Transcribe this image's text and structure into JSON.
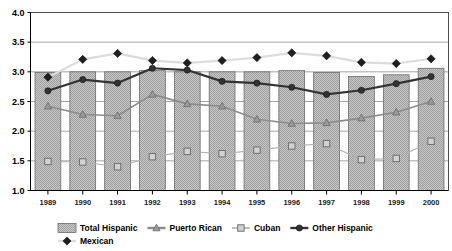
{
  "chart_data": {
    "type": "bar",
    "title": "",
    "xlabel": "",
    "ylabel": "",
    "ylim": [
      1.0,
      4.0
    ],
    "ytick_labels": [
      "1.0",
      "1.5",
      "2.0",
      "2.5",
      "3.0",
      "3.5",
      "4.0"
    ],
    "ytick_values": [
      1.0,
      1.5,
      2.0,
      2.5,
      3.0,
      3.5,
      4.0
    ],
    "grid": true,
    "legend_position": "bottom",
    "categories": [
      "1989",
      "1990",
      "1991",
      "1992",
      "1993",
      "1994",
      "1995",
      "1996",
      "1997",
      "1998",
      "1999",
      "2000"
    ],
    "series": [
      {
        "name": "Total Hispanic",
        "kind": "bar",
        "marker": "bar",
        "color": "#aaaaaa",
        "values": [
          2.99,
          3.0,
          3.0,
          3.02,
          3.0,
          3.0,
          3.0,
          3.02,
          2.99,
          2.92,
          2.95,
          3.06
        ]
      },
      {
        "name": "Puerto Rican",
        "kind": "line",
        "marker": "triangle",
        "color": "#8c8c8c",
        "values": [
          2.42,
          2.28,
          2.26,
          2.62,
          2.46,
          2.42,
          2.2,
          2.13,
          2.14,
          2.22,
          2.32,
          2.5
        ]
      },
      {
        "name": "Cuban",
        "kind": "line",
        "marker": "square",
        "color": "#b0b0b0",
        "values": [
          1.49,
          1.48,
          1.4,
          1.57,
          1.66,
          1.62,
          1.68,
          1.75,
          1.79,
          1.52,
          1.54,
          1.83
        ]
      },
      {
        "name": "Other Hispanic",
        "kind": "line",
        "marker": "circle",
        "color": "#333333",
        "values": [
          2.68,
          2.87,
          2.81,
          3.06,
          3.03,
          2.84,
          2.81,
          2.74,
          2.62,
          2.69,
          2.8,
          2.92
        ]
      },
      {
        "name": "Mexican",
        "kind": "line",
        "marker": "diamond",
        "color": "#1a1a1a",
        "line_color": "#dcdcdc",
        "values": [
          2.91,
          3.21,
          3.31,
          3.19,
          3.15,
          3.19,
          3.24,
          3.32,
          3.27,
          3.16,
          3.14,
          3.22
        ]
      }
    ]
  },
  "legend": {
    "items": [
      {
        "label": "Total Hispanic",
        "marker": "bar"
      },
      {
        "label": "Puerto Rican",
        "marker": "triangle"
      },
      {
        "label": "Cuban",
        "marker": "square"
      },
      {
        "label": "Other Hispanic",
        "marker": "circle"
      },
      {
        "label": "Mexican",
        "marker": "diamond"
      }
    ]
  }
}
